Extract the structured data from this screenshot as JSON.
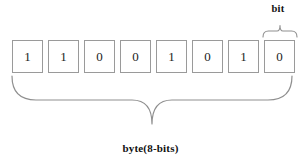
{
  "diagram": {
    "title_top_label": "bit",
    "title_bottom_label": "byte(8-bits)",
    "bits": [
      {
        "value": "1"
      },
      {
        "value": "1"
      },
      {
        "value": "0"
      },
      {
        "value": "0"
      },
      {
        "value": "1"
      },
      {
        "value": "0"
      },
      {
        "value": "1"
      },
      {
        "value": "0"
      }
    ],
    "bit_string": "11001010",
    "bit_count": 8,
    "colors": {
      "background": "#ffffff",
      "box_border": "#9a9a9a",
      "brace_stroke": "#8f8f8f",
      "text": "#111111"
    },
    "annotations": {
      "top_brace_spans": "last bit box",
      "bottom_brace_spans": "all 8 bit boxes"
    }
  }
}
